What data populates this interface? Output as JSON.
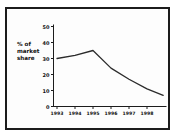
{
  "window": {
    "background_color": "#ffffff",
    "frame_border_color": "#1c1c1c"
  },
  "chart_data": {
    "type": "line",
    "title": "",
    "xlabel": "",
    "ylabel": "% of market share",
    "ylabel_lines": [
      "% of",
      "market",
      "share"
    ],
    "x_tick_labels": [
      "1993",
      "1994",
      "1995",
      "1996",
      "1997",
      "1998"
    ],
    "y_tick_values": [
      0,
      10,
      20,
      30,
      40,
      50
    ],
    "ylim": [
      0,
      50
    ],
    "grid": false,
    "legend_position": "none",
    "line_color": "#2b2b2b",
    "axis_color": "#1c1c1c",
    "series": [
      {
        "name": "percent-market-share",
        "points": [
          {
            "x": 1993,
            "y": 30
          },
          {
            "x": 1994,
            "y": 32
          },
          {
            "x": 1995,
            "y": 35
          },
          {
            "x": 1996,
            "y": 24
          },
          {
            "x": 1997,
            "y": 17
          },
          {
            "x": 1998,
            "y": 11
          },
          {
            "x": 1998.9,
            "y": 7
          }
        ]
      }
    ]
  }
}
